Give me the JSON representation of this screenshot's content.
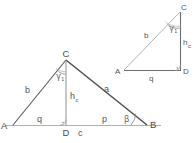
{
  "figure": {
    "kind": "geometry-diagram",
    "stroke_dark": "#4d4d4d",
    "stroke_light": "#a8a8a8",
    "stroke_mid": "#8c8c8c",
    "text_color": "#555555",
    "background": "#ffffff"
  },
  "main_triangle": {
    "name": "main-triangle-ABC",
    "vertices": {
      "A": {
        "label": "A",
        "x": 13,
        "y": 125
      },
      "B": {
        "label": "B",
        "x": 147,
        "y": 125
      },
      "C": {
        "label": "C",
        "x": 66,
        "y": 60
      },
      "D": {
        "label": "D",
        "x": 66,
        "y": 125
      }
    },
    "sides": {
      "b": {
        "label": "b",
        "x": 28,
        "y": 90,
        "note": "side AC"
      },
      "a": {
        "label": "a",
        "x": 104,
        "y": 91,
        "note": "side CB"
      },
      "q": {
        "label": "q",
        "x": 40,
        "y": 121,
        "note": "segment AD"
      },
      "p": {
        "label": "p",
        "x": 104,
        "y": 121,
        "note": "segment DB"
      },
      "c": {
        "label": "c",
        "x": 81,
        "y": 136,
        "note": "side AB"
      },
      "h": {
        "label": "h",
        "sub": "c",
        "x": 71,
        "y": 98,
        "note": "altitude CD"
      }
    },
    "angles": {
      "gamma1": {
        "label": "γ",
        "sub": "1",
        "x": 58,
        "y": 77,
        "note": "angle ACD at C"
      },
      "beta": {
        "label": "β",
        "x": 127,
        "y": 121,
        "note": "angle at B"
      },
      "right_angle_D": {
        "label": "right-angle-marker",
        "x": 66,
        "y": 125
      }
    },
    "baseline": {
      "x_start": 5,
      "x_end": 161,
      "y": 125
    }
  },
  "small_triangle": {
    "name": "small-triangle-ACD",
    "vertices": {
      "A": {
        "label": "A",
        "x": 124,
        "y": 70
      },
      "C": {
        "label": "C",
        "x": 180,
        "y": 12
      },
      "D": {
        "label": "D",
        "x": 180,
        "y": 70
      }
    },
    "sides": {
      "b": {
        "label": "b",
        "x": 147,
        "y": 35,
        "note": "hypotenuse AC"
      },
      "q": {
        "label": "q",
        "x": 151,
        "y": 80,
        "note": "base AD"
      },
      "h": {
        "label": "h",
        "sub": "c",
        "x": 185,
        "y": 42,
        "note": "vertical leg CD"
      }
    },
    "angles": {
      "gamma1": {
        "label": "γ",
        "sub": "1",
        "x": 171,
        "y": 29,
        "note": "angle ACD at C"
      },
      "right_angle_D": {
        "label": "right-angle-marker",
        "x": 180,
        "y": 70
      }
    }
  }
}
